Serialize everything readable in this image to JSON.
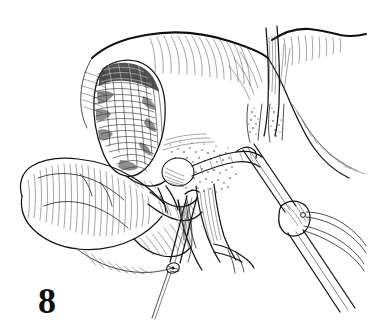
{
  "figure": {
    "number": "8",
    "caption_label": "8",
    "domain": "surgical-line-art-illustration",
    "medium": "pen-and-ink hatched drawing",
    "background_color": "#ffffff",
    "ink_color": "#1a1a1a",
    "width_px": 387,
    "height_px": 333
  },
  "anatomy": {
    "structures": [
      {
        "id": "liver",
        "label": "Liver",
        "position": "upper-center-right",
        "shading": "fine parallel hatching along inferior edge"
      },
      {
        "id": "gallbladder",
        "label": "Gallbladder",
        "position": "upper-left-center",
        "shading": "dense cross-hatching, darkest region of figure"
      },
      {
        "id": "falciform-ligament",
        "label": "Falciform ligament",
        "position": "upper-right",
        "shading": "vertical band with converging hatch lines"
      },
      {
        "id": "duodenum",
        "label": "Duodenum",
        "position": "left",
        "shading": "contour hatching, lobulated outline"
      },
      {
        "id": "pancreas-head",
        "label": "Head of pancreas",
        "position": "lower-left-center",
        "shading": "short curved hatch strokes"
      },
      {
        "id": "cystic-duct",
        "label": "Cystic duct",
        "position": "center",
        "shading": "outlined tube"
      },
      {
        "id": "common-bile-duct",
        "label": "Common bile duct",
        "position": "center-lower",
        "shading": "outlined tube with lengthwise hatching"
      },
      {
        "id": "portal-vein",
        "label": "Portal vein",
        "position": "lower-center",
        "shading": "broad hatched vessel with bifurcation"
      },
      {
        "id": "hepatic-artery",
        "label": "Hepatic artery",
        "position": "center",
        "shading": "thin branching vessel"
      },
      {
        "id": "fatty-areolar-tissue",
        "label": "Fatty areolar tissue of porta hepatis",
        "position": "center",
        "shading": "stippled dotted texture"
      }
    ]
  },
  "instruments": [
    {
      "id": "clip-applier",
      "label": "Laparoscopic clip applier",
      "entry": "lower-right",
      "tip_position": "porta hepatis",
      "shading": "tubular shaft with longitudinal highlight, hinged jaws"
    },
    {
      "id": "grasper",
      "label": "Laparoscopic grasper",
      "entry": "lower-center",
      "tip_position": "cystic duct",
      "shading": "slender shaft with small hinged clip at tip"
    }
  ],
  "legend": {
    "visible_text_items": [
      "8"
    ],
    "has_labels": false,
    "has_leader_lines": false
  }
}
